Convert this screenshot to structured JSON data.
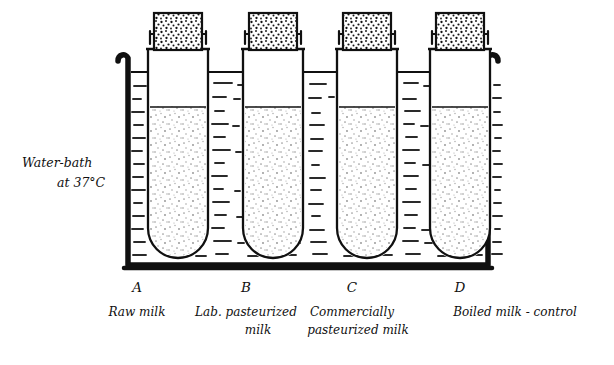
{
  "figure": {
    "bath_label_line1": "Water-bath",
    "bath_label_line2": "at 37°C",
    "colors": {
      "ink": "#101010",
      "background": "#ffffff",
      "milk_stipple": "#9a9a9a",
      "water_dash": "#2a2a2a",
      "stopper_dot": "#111111"
    },
    "bath": {
      "name": "water-bath",
      "temperature": "37°C",
      "wall_thickness_px": 5,
      "water_level_y": 72
    },
    "tubes": [
      {
        "letter": "A",
        "caption_line1": "Raw milk",
        "caption_line2": "",
        "contents": "raw milk",
        "stopper": "cotton-plug",
        "center_x": 178,
        "fill_top_y": 108
      },
      {
        "letter": "B",
        "caption_line1": "Lab. pasteurized",
        "caption_line2": "milk",
        "contents": "laboratory pasteurized milk",
        "stopper": "cotton-plug",
        "center_x": 273,
        "fill_top_y": 108
      },
      {
        "letter": "C",
        "caption_line1": "Commercially",
        "caption_line2": "pasteurized milk",
        "contents": "commercially pasteurized milk",
        "stopper": "cotton-plug",
        "center_x": 367,
        "fill_top_y": 108
      },
      {
        "letter": "D",
        "caption_line1": "Boiled milk - control",
        "caption_line2": "",
        "contents": "boiled milk (control)",
        "stopper": "cotton-plug",
        "center_x": 460,
        "fill_top_y": 108
      }
    ]
  }
}
